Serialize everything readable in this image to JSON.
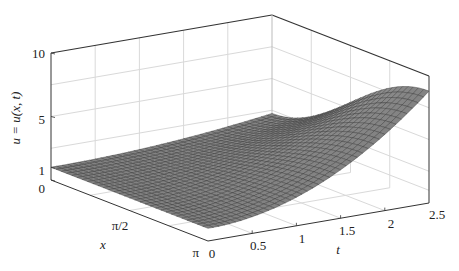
{
  "chart_data": {
    "type": "surface",
    "title": "",
    "xlabel": "x",
    "ylabel": "t",
    "zlabel": "u = u(x, t)",
    "x_ticks": [
      "0",
      "π/2",
      "π"
    ],
    "x_tick_values": [
      0,
      1.5708,
      3.1416
    ],
    "t_ticks": [
      "0",
      "0.5",
      "1",
      "1.5",
      "2",
      "2.5"
    ],
    "t_tick_values": [
      0,
      0.5,
      1,
      1.5,
      2,
      2.5
    ],
    "z_ticks": [
      "0",
      "1",
      "5",
      "10"
    ],
    "z_tick_values": [
      0,
      1,
      5,
      10
    ],
    "xlim": [
      0,
      3.1416
    ],
    "tlim": [
      0,
      2.5
    ],
    "zlim": [
      0,
      10
    ],
    "grid": true,
    "surface_model": "u = 1 + t^2 * (0.2 + 1.05 * (1 - cos x) / 2)",
    "sample_points": [
      {
        "x": 0,
        "t": 0,
        "u": 1
      },
      {
        "x": 3.1416,
        "t": 0,
        "u": 1
      },
      {
        "x": 0,
        "t": 2.5,
        "u": 2.3
      },
      {
        "x": 3.1416,
        "t": 1.5,
        "u": 3.7
      },
      {
        "x": 3.1416,
        "t": 2,
        "u": 6
      },
      {
        "x": 3.1416,
        "t": 2.5,
        "u": 9
      }
    ],
    "surface_color": "#8c8c8c",
    "mesh_color": "#3a3a3a",
    "grid_color": "#d9d9d9",
    "axis_color": "#333333"
  }
}
